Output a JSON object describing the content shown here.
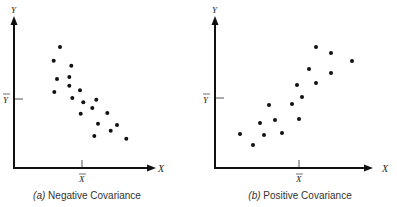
{
  "chart_data": [
    {
      "type": "scatter",
      "title": "Negative Covariance",
      "caption_prefix": "(a)",
      "caption_text": "Negative Covariance",
      "xlabel": "X",
      "ylabel": "Y",
      "x_mean_label": "X̄",
      "y_mean_label": "Ȳ",
      "grid": false,
      "points_px": [
        [
          60,
          47
        ],
        [
          53.7,
          60.7
        ],
        [
          71.3,
          65.7
        ],
        [
          57,
          79
        ],
        [
          69.3,
          77
        ],
        [
          69.3,
          85.7
        ],
        [
          54.3,
          92
        ],
        [
          80,
          90.3
        ],
        [
          72.3,
          98
        ],
        [
          83.3,
          102.3
        ],
        [
          96.3,
          99.7
        ],
        [
          92.3,
          108
        ],
        [
          80.7,
          113.7
        ],
        [
          107.3,
          113
        ],
        [
          98,
          123.7
        ],
        [
          117,
          125
        ],
        [
          110.7,
          130.7
        ],
        [
          94.3,
          136
        ],
        [
          126.3,
          138.7
        ]
      ]
    },
    {
      "type": "scatter",
      "title": "Positive Covariance",
      "caption_prefix": "(b)",
      "caption_text": "Positive Covariance",
      "xlabel": "X",
      "ylabel": "Y",
      "x_mean_label": "X̄",
      "y_mean_label": "Ȳ",
      "grid": false,
      "points_px": [
        [
          240,
          134
        ],
        [
          253,
          145
        ],
        [
          260,
          123
        ],
        [
          264,
          135
        ],
        [
          269,
          105
        ],
        [
          275,
          120
        ],
        [
          282,
          133
        ],
        [
          292,
          104
        ],
        [
          299,
          119
        ],
        [
          297,
          85
        ],
        [
          302,
          97
        ],
        [
          309,
          69
        ],
        [
          316,
          83
        ],
        [
          316,
          47
        ],
        [
          331,
          53
        ],
        [
          331,
          73
        ],
        [
          352,
          61
        ]
      ]
    }
  ],
  "panels": {
    "a": {
      "prefix": "(a)",
      "caption": "Negative Covariance",
      "xlabel": "X",
      "ylabel": "Y",
      "xmean": "X",
      "ymean": "Y"
    },
    "b": {
      "prefix": "(b)",
      "caption": "Positive Covariance",
      "xlabel": "X",
      "ylabel": "Y",
      "xmean": "X",
      "ymean": "Y"
    }
  }
}
